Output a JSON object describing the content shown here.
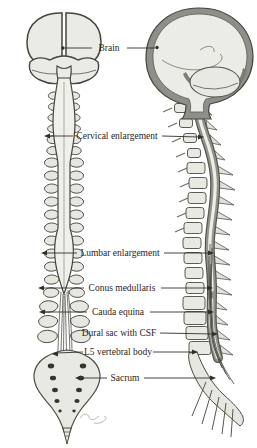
{
  "figure_labels": {
    "labels": [
      {
        "text": "Brain",
        "pointer": "both",
        "marker": "dot"
      },
      {
        "text": "Cervical enlargement",
        "pointer": "both",
        "marker": "arrow"
      },
      {
        "text": "Lumbar enlargement",
        "pointer": "both",
        "marker": "arrow"
      },
      {
        "text": "Conus medullaris",
        "pointer": "both",
        "marker": "arrow"
      },
      {
        "text": "Cauda equina",
        "pointer": "both",
        "marker": "arrow"
      },
      {
        "text": "Dural sac with CSF",
        "pointer": "right",
        "marker": "arrow"
      },
      {
        "text": "L5 vertebral body",
        "pointer": "both",
        "marker": "arrow"
      },
      {
        "text": "Sacrum",
        "pointer": "both",
        "marker": "arrow"
      }
    ]
  },
  "colors": {
    "background": "#ffffff",
    "outline_dark": "#45443e",
    "fill_light": "#ebebe5",
    "fill_lighter": "#f1f1ec",
    "dura_gray": "#90908a",
    "shade_dark": "#5d5c55",
    "label_text": "#2b241c",
    "leader_line": "#33302a"
  }
}
